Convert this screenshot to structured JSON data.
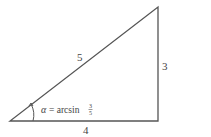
{
  "diagram": {
    "type": "right-triangle",
    "hypotenuse_label": "5",
    "opposite_label": "3",
    "adjacent_label": "4",
    "angle_label": {
      "symbol": "α",
      "equals": "= arcsin",
      "fraction_numerator": "3",
      "fraction_denominator": "5"
    },
    "line_color": "#555555"
  }
}
